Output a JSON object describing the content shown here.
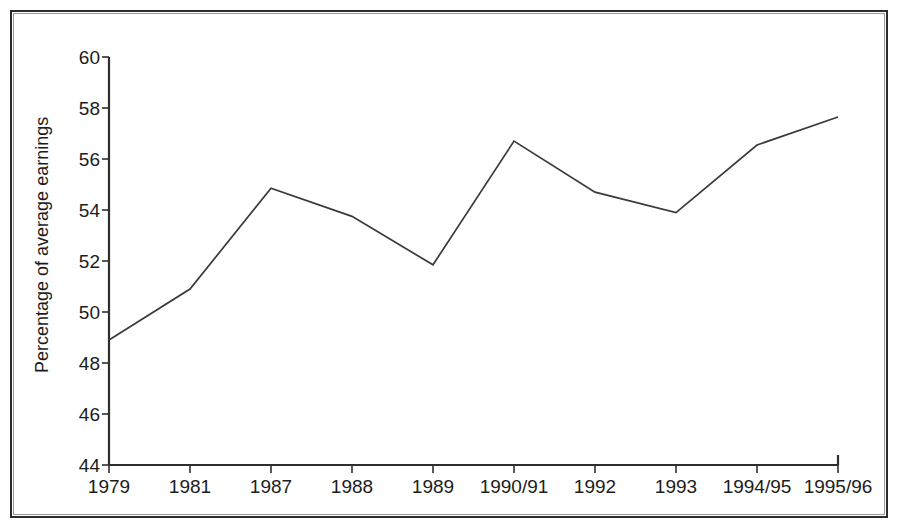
{
  "chart_data": {
    "type": "line",
    "title": "",
    "subtitle": "",
    "xlabel": "",
    "ylabel": "Percentage of average earnings",
    "categories": [
      "1979",
      "1981",
      "1987",
      "1988",
      "1989",
      "1990/91",
      "1992",
      "1993",
      "1994/95",
      "1995/96"
    ],
    "values": [
      48.9,
      50.9,
      54.85,
      53.75,
      51.85,
      56.7,
      54.7,
      53.9,
      56.55,
      57.65
    ],
    "series": [
      {
        "name": "Percentage of average earnings",
        "values": [
          48.9,
          50.9,
          54.85,
          53.75,
          51.85,
          56.7,
          54.7,
          53.9,
          56.55,
          57.65
        ]
      }
    ],
    "ylim": [
      44,
      60
    ],
    "yticks": [
      44,
      46,
      48,
      50,
      52,
      54,
      56,
      58,
      60
    ],
    "ytick_labels": [
      "44",
      "46",
      "48",
      "50",
      "52",
      "54",
      "56",
      "58",
      "60"
    ],
    "xtick_labels": [
      "1979",
      "1981",
      "1987",
      "1988",
      "1989",
      "1990/91",
      "1992",
      "1993",
      "1994/95",
      "1995/96"
    ],
    "grid": false,
    "legend": false,
    "legend_position": "none",
    "line_color": "#3a3a3a",
    "axis_color": "#2e2e2e",
    "background_color": "#ffffff"
  },
  "figure": {
    "border_color": "#2b2b2b"
  }
}
